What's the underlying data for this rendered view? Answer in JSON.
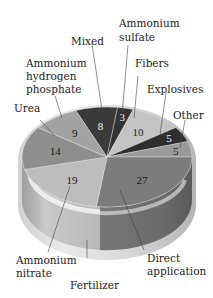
{
  "chart_data": {
    "type": "pie",
    "style": "3d-cylinder",
    "title": "",
    "group_label": "Fertilizer",
    "unit": "%",
    "slices": [
      {
        "label": "Mixed",
        "value": 8,
        "color": "#3a3a3a",
        "text_light": true
      },
      {
        "label": "Ammonium sulfate",
        "value": 3,
        "color": "#333333",
        "text_light": true
      },
      {
        "label": "Fibers",
        "value": 10,
        "color": "#c4c4c4",
        "text_light": false
      },
      {
        "label": "Explosives",
        "value": 5,
        "color": "#2e2e2e",
        "text_light": true
      },
      {
        "label": "Other",
        "value": 5,
        "color": "#9a9a9a",
        "text_light": false
      },
      {
        "label": "Direct application",
        "value": 27,
        "color": "#7c7c7c",
        "text_light": false
      },
      {
        "label": "Ammonium nitrate",
        "value": 19,
        "color": "#bdbdbd",
        "text_light": false
      },
      {
        "label": "Urea",
        "value": 14,
        "color": "#8e8e8e",
        "text_light": false
      },
      {
        "label": "Ammonium hydrogen phosphate",
        "value": 9,
        "color": "#a3a3a3",
        "text_light": false
      }
    ],
    "fertilizer_members": [
      "Mixed",
      "Ammonium sulfate",
      "Direct application",
      "Ammonium nitrate",
      "Urea",
      "Ammonium hydrogen phosphate"
    ],
    "start_angle_deg": -21.6,
    "legend": "none (leader-line labels)"
  },
  "labels": {
    "mixed": "Mixed",
    "ammonium_sulfate": [
      "Ammonium",
      "sulfate"
    ],
    "fibers": "Fibers",
    "explosives": "Explosives",
    "other": "Other",
    "urea": "Urea",
    "ammonium_hydrogen_phosphate": [
      "Ammonium",
      "hydrogen",
      "phosphate"
    ],
    "ammonium_nitrate": [
      "Ammonium",
      "nitrate"
    ],
    "direct_application": [
      "Direct",
      "application"
    ],
    "fertilizer": "Fertilizer"
  }
}
